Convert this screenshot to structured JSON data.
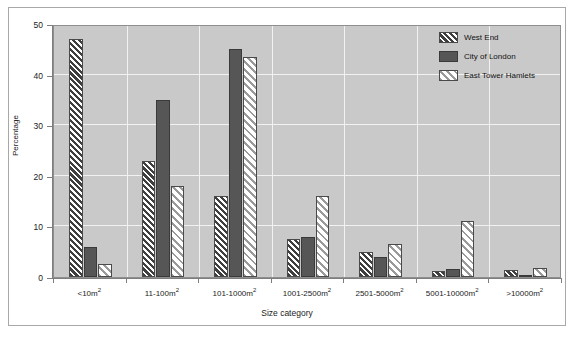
{
  "chart_data": {
    "type": "bar",
    "title": "",
    "subtitle": "",
    "xlabel": "Size category",
    "ylabel": "Percentage",
    "ylim": [
      0,
      50
    ],
    "yticks": [
      0,
      10,
      20,
      30,
      40,
      50
    ],
    "ytick_labels": [
      "0",
      "10",
      "20",
      "30",
      "40",
      "50"
    ],
    "grid": "horizontal-and-vertical-white-gridlines",
    "legend_position": "top-right-inside",
    "categories": [
      "<10m²",
      "11-100m²",
      "101-1000m²",
      "1001-2500m²",
      "2501-5000m²",
      "5001-10000m²",
      ">10000m²"
    ],
    "category_parts": [
      {
        "base": "<10m",
        "sup": "2"
      },
      {
        "base": "11-100m",
        "sup": "2"
      },
      {
        "base": "101-1000m",
        "sup": "2"
      },
      {
        "base": "1001-2500m",
        "sup": "2"
      },
      {
        "base": "2501-5000m",
        "sup": "2"
      },
      {
        "base": "5001-10000m",
        "sup": "2"
      },
      {
        "base": ">10000m",
        "sup": "2"
      }
    ],
    "series": [
      {
        "name": "West End",
        "fill": "dark-diagonal-hatch",
        "color": "#3f3f3f",
        "values": [
          47,
          23,
          16,
          7.5,
          5,
          1.2,
          1.3
        ]
      },
      {
        "name": "City of London",
        "fill": "solid",
        "color": "#565656",
        "values": [
          6,
          35,
          45,
          8,
          4,
          1.5,
          0.3
        ]
      },
      {
        "name": "East Tower Hamlets",
        "fill": "light-diagonal-hatch",
        "color": "#9a9a9a",
        "values": [
          2.5,
          18,
          43.5,
          16,
          6.5,
          11,
          1.8
        ]
      }
    ]
  },
  "style": {
    "plot_background": "#c9c9c9",
    "page_background": "#ffffff",
    "gridline_color": "#f2f2f2",
    "axis_color": "#7d7d7d",
    "frame_border": "#a8a8a8"
  }
}
